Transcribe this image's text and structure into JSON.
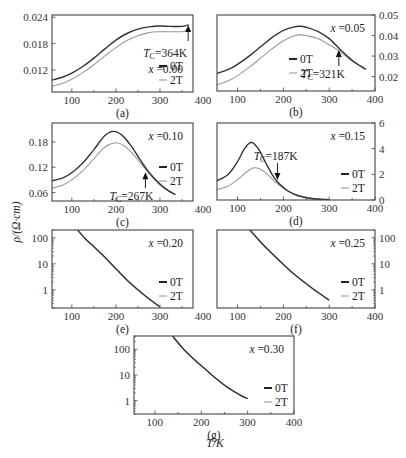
{
  "figure": {
    "y_axis_label": "ρ/(Ω·cm)",
    "x_axis_label": "T/K"
  },
  "chart_data": [
    {
      "panel": "(a)",
      "type": "line",
      "composition": "x =0.00",
      "tc_label": "T_C=364K",
      "tc": 364,
      "tc_arrow": "up",
      "xlabel": "T/K",
      "ylabel": "ρ/(Ω·cm)",
      "yscale": "linear",
      "yaxis_side": "left",
      "xlim": [
        55,
        375
      ],
      "ylim": [
        0.007,
        0.0245
      ],
      "xticks": [
        100,
        200,
        300,
        400
      ],
      "yticks": [
        0.012,
        0.018,
        0.024
      ],
      "ytick_labels": [
        "0.012",
        "0.018",
        "0.024"
      ],
      "legend": [
        "0T",
        "2T"
      ],
      "series": [
        {
          "name": "0T",
          "x": [
            55,
            80,
            100,
            125,
            150,
            175,
            200,
            225,
            250,
            275,
            300,
            325,
            350,
            365
          ],
          "y": [
            0.0097,
            0.0104,
            0.0113,
            0.0128,
            0.0147,
            0.0168,
            0.0188,
            0.0203,
            0.0213,
            0.0218,
            0.022,
            0.0219,
            0.0219,
            0.0223
          ]
        },
        {
          "name": "2T",
          "x": [
            55,
            80,
            100,
            125,
            150,
            175,
            200,
            225,
            250,
            275,
            300,
            325,
            350,
            365
          ],
          "y": [
            0.0083,
            0.009,
            0.0099,
            0.0114,
            0.0132,
            0.0152,
            0.0171,
            0.0187,
            0.0198,
            0.0205,
            0.0207,
            0.0207,
            0.0207,
            0.0211
          ]
        }
      ]
    },
    {
      "panel": "(b)",
      "type": "line",
      "composition": "x =0.05",
      "tc_label": "T_C=321K",
      "tc": 321,
      "tc_arrow": "up",
      "xlabel": "T/K",
      "ylabel": "ρ/(Ω·cm)",
      "yscale": "linear",
      "yaxis_side": "right",
      "xlim": [
        55,
        400
      ],
      "ylim": [
        0.013,
        0.05
      ],
      "xticks": [
        100,
        200,
        300,
        400
      ],
      "yticks": [
        0.02,
        0.03,
        0.04,
        0.05
      ],
      "ytick_labels": [
        "0.02",
        "0.03",
        "0.04",
        "0.05"
      ],
      "legend": [
        "0T",
        "2T"
      ],
      "series": [
        {
          "name": "0T",
          "x": [
            55,
            80,
            100,
            125,
            150,
            175,
            200,
            225,
            235,
            250,
            275,
            300,
            325,
            350,
            380
          ],
          "y": [
            0.0215,
            0.0235,
            0.026,
            0.03,
            0.0345,
            0.039,
            0.0425,
            0.0443,
            0.0445,
            0.044,
            0.042,
            0.0385,
            0.033,
            0.028,
            0.0235
          ]
        },
        {
          "name": "2T",
          "x": [
            55,
            80,
            100,
            125,
            150,
            175,
            200,
            225,
            240,
            250,
            275,
            300,
            325,
            350,
            380
          ],
          "y": [
            0.016,
            0.018,
            0.0205,
            0.0245,
            0.029,
            0.0335,
            0.0375,
            0.04,
            0.0403,
            0.04,
            0.0385,
            0.0355,
            0.032,
            0.0275,
            0.0235
          ]
        }
      ]
    },
    {
      "panel": "(c)",
      "type": "line",
      "composition": "x =0.10",
      "tc_label": "T_C=267K",
      "tc": 267,
      "tc_arrow": "up",
      "xlabel": "T/K",
      "ylabel": "ρ/(Ω·cm)",
      "yscale": "linear",
      "yaxis_side": "left",
      "xlim": [
        55,
        375
      ],
      "ylim": [
        0.04,
        0.225
      ],
      "xticks": [
        100,
        200,
        300,
        400
      ],
      "yticks": [
        0.06,
        0.12,
        0.18
      ],
      "ytick_labels": [
        "0.06",
        "0.12",
        "0.18"
      ],
      "legend": [
        "0T",
        "2T"
      ],
      "series": [
        {
          "name": "0T",
          "x": [
            55,
            80,
            100,
            125,
            150,
            175,
            195,
            215,
            235,
            255,
            275,
            300,
            320,
            335
          ],
          "y": [
            0.088,
            0.095,
            0.107,
            0.13,
            0.162,
            0.195,
            0.205,
            0.195,
            0.17,
            0.138,
            0.108,
            0.08,
            0.064,
            0.055
          ]
        },
        {
          "name": "2T",
          "x": [
            55,
            80,
            100,
            125,
            150,
            175,
            200,
            220,
            240,
            260,
            280,
            300,
            320,
            335
          ],
          "y": [
            0.07,
            0.078,
            0.09,
            0.112,
            0.14,
            0.168,
            0.178,
            0.17,
            0.15,
            0.125,
            0.1,
            0.078,
            0.063,
            0.055
          ]
        }
      ]
    },
    {
      "panel": "(d)",
      "type": "line",
      "composition": "x =0.15",
      "tc_label": "T_C=187K",
      "tc": 187,
      "tc_arrow": "down",
      "xlabel": "T/K",
      "ylabel": "ρ/(Ω·cm)",
      "yscale": "linear",
      "yaxis_side": "right",
      "xlim": [
        55,
        400
      ],
      "ylim": [
        0,
        6
      ],
      "xticks": [
        100,
        200,
        300,
        400
      ],
      "yticks": [
        0,
        2,
        4,
        6
      ],
      "ytick_labels": [
        "0",
        "2",
        "4",
        "6"
      ],
      "legend": [
        "0T",
        "2T"
      ],
      "series": [
        {
          "name": "0T",
          "x": [
            55,
            80,
            100,
            115,
            130,
            145,
            160,
            175,
            190,
            210,
            230,
            260,
            300
          ],
          "y": [
            1.5,
            2.0,
            3.0,
            4.0,
            4.5,
            4.0,
            3.0,
            2.0,
            1.3,
            0.7,
            0.35,
            0.12,
            0.02
          ]
        },
        {
          "name": "2T",
          "x": [
            55,
            80,
            100,
            120,
            135,
            150,
            165,
            180,
            195,
            215,
            240,
            270,
            300
          ],
          "y": [
            0.8,
            1.1,
            1.6,
            2.2,
            2.5,
            2.4,
            2.0,
            1.5,
            1.05,
            0.6,
            0.3,
            0.1,
            0.02
          ]
        }
      ]
    },
    {
      "panel": "(e)",
      "type": "line",
      "composition": "x =0.20",
      "xlabel": "T/K",
      "ylabel": "ρ/(Ω·cm)",
      "yscale": "log",
      "yaxis_side": "left",
      "xlim": [
        55,
        375
      ],
      "ylim": [
        0.2,
        200
      ],
      "xticks": [
        100,
        200,
        300,
        400
      ],
      "yticks": [
        1,
        10,
        100
      ],
      "ytick_labels": [
        "1",
        "10",
        "100"
      ],
      "legend": [
        "0T",
        "2T"
      ],
      "series": [
        {
          "name": "0T",
          "x": [
            113,
            130,
            150,
            175,
            200,
            225,
            250,
            275,
            300
          ],
          "y": [
            200,
            95,
            45,
            18,
            6.5,
            2.4,
            1.0,
            0.45,
            0.22
          ]
        },
        {
          "name": "2T",
          "x": [
            113,
            130,
            150,
            175,
            200,
            225,
            250,
            275,
            300
          ],
          "y": [
            200,
            95,
            45,
            18,
            6.5,
            2.4,
            1.0,
            0.45,
            0.22
          ]
        }
      ]
    },
    {
      "panel": "(f)",
      "type": "line",
      "composition": "x =0.25",
      "xlabel": "T/K",
      "ylabel": "ρ/(Ω·cm)",
      "yscale": "log",
      "yaxis_side": "right",
      "xlim": [
        55,
        400
      ],
      "ylim": [
        0.2,
        200
      ],
      "xticks": [
        100,
        200,
        300,
        400
      ],
      "yticks": [
        1,
        10,
        100
      ],
      "ytick_labels": [
        "1",
        "10",
        "100"
      ],
      "legend": [
        "0T",
        "2T"
      ],
      "series": [
        {
          "name": "0T",
          "x": [
            127,
            150,
            175,
            200,
            225,
            250,
            275,
            300
          ],
          "y": [
            200,
            70,
            25,
            9.5,
            3.8,
            1.7,
            0.8,
            0.4
          ]
        },
        {
          "name": "2T",
          "x": [
            127,
            150,
            175,
            200,
            225,
            250,
            275,
            300
          ],
          "y": [
            200,
            70,
            25,
            9.5,
            3.8,
            1.7,
            0.8,
            0.4
          ]
        }
      ]
    },
    {
      "panel": "(g)",
      "type": "line",
      "composition": "x =0.30",
      "xlabel": "T/K",
      "ylabel": "ρ/(Ω·cm)",
      "yscale": "log",
      "yaxis_side": "left",
      "xlim": [
        55,
        400
      ],
      "ylim": [
        0.3,
        330
      ],
      "xticks": [
        100,
        200,
        300,
        400
      ],
      "yticks": [
        1,
        10,
        100
      ],
      "ytick_labels": [
        "1",
        "10",
        "100"
      ],
      "legend": [
        "0T",
        "2T"
      ],
      "series": [
        {
          "name": "0T",
          "x": [
            138,
            160,
            185,
            210,
            235,
            260,
            285,
            300
          ],
          "y": [
            330,
            110,
            40,
            16,
            6.5,
            3.0,
            1.6,
            1.2
          ]
        },
        {
          "name": "2T",
          "x": [
            138,
            160,
            185,
            210,
            235,
            260,
            285,
            300
          ],
          "y": [
            330,
            110,
            40,
            16,
            6.5,
            3.0,
            1.6,
            1.2
          ]
        }
      ]
    }
  ],
  "layout": {
    "frames": [
      {
        "x": 52,
        "y": 15,
        "w": 141,
        "h": 77
      },
      {
        "x": 217,
        "y": 15,
        "w": 158,
        "h": 76
      },
      {
        "x": 52,
        "y": 123,
        "w": 141,
        "h": 78
      },
      {
        "x": 217,
        "y": 123,
        "w": 158,
        "h": 77
      },
      {
        "x": 52,
        "y": 230,
        "w": 141,
        "h": 78
      },
      {
        "x": 217,
        "y": 230,
        "w": 158,
        "h": 78
      },
      {
        "x": 134,
        "y": 336,
        "w": 160,
        "h": 78
      }
    ]
  }
}
